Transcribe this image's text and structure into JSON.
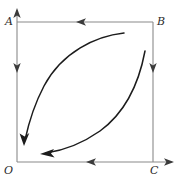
{
  "figure": {
    "type": "cycle-diagram",
    "background_color": "#ffffff",
    "axis_color": "#8a8a8a",
    "curve_color": "#1c1c1c",
    "label_color": "#2b2b2b",
    "vertices": [
      {
        "key": "A",
        "label": "A",
        "position": "top-left",
        "x": 17,
        "y": 22
      },
      {
        "key": "B",
        "label": "B",
        "position": "top-right",
        "x": 153,
        "y": 22
      },
      {
        "key": "O",
        "label": "O",
        "position": "bottom-left",
        "x": 17,
        "y": 162
      },
      {
        "key": "C",
        "label": "C",
        "position": "bottom-right",
        "x": 153,
        "y": 162
      }
    ],
    "axes": {
      "vertical": {
        "name": "y-axis",
        "from_x": 17,
        "from_y": 162,
        "to_x": 17,
        "to_y": 10,
        "arrow": "up"
      },
      "horizontal": {
        "name": "x-axis",
        "from_x": 17,
        "from_y": 162,
        "to_x": 172,
        "to_y": 162,
        "arrow": "right"
      }
    },
    "rectangle_edges": [
      {
        "name": "edge-A-B",
        "from": "A",
        "to": "B",
        "flow_arrow_direction": "left",
        "arrow_x": 82,
        "arrow_y": 22
      },
      {
        "name": "edge-B-C",
        "from": "B",
        "to": "C",
        "flow_arrow_direction": "down",
        "arrow_x": 153,
        "arrow_y": 67
      },
      {
        "name": "edge-C-O",
        "from": "C",
        "to": "O",
        "flow_arrow_direction": "left",
        "arrow_x": 92,
        "arrow_y": 162
      },
      {
        "name": "edge-A-O",
        "from": "A",
        "to": "O",
        "flow_arrow_direction": "down",
        "arrow_x": 17,
        "arrow_y": 67
      }
    ],
    "curves": [
      {
        "name": "upper-curve",
        "shape": "concave-decreasing",
        "start_x": 124,
        "start_y": 33,
        "end_x": 25,
        "end_y": 140,
        "arrow_at": "end",
        "arrow_direction": "down-left",
        "path": "M 124 33 C 96 36, 62 52, 44 86 C 33 107, 28 126, 25 140"
      },
      {
        "name": "lower-curve",
        "shape": "convex-decreasing",
        "start_x": 145,
        "start_y": 51,
        "end_x": 46,
        "end_y": 153,
        "arrow_at": "end",
        "arrow_direction": "left",
        "path": "M 145 51 C 139 83, 126 112, 100 131 C 80 145, 60 151, 46 153"
      }
    ]
  }
}
